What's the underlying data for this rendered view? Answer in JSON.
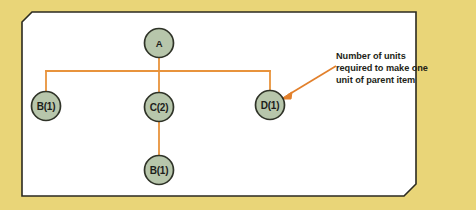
{
  "figure": {
    "kind": "bill-of-materials-tree",
    "panel_background": "#ffffff",
    "page_background": "#e9d578",
    "border_color": "#2b2a20",
    "connector_color": "#e8933c",
    "node_fill": "#b7c6ab",
    "node_stroke": "#2f3328",
    "text_color": "#1d1d1b"
  },
  "nodes": {
    "root": {
      "label": "A",
      "name": "node-a"
    },
    "child_left": {
      "label": "B(1)",
      "name": "node-b-left"
    },
    "child_middle": {
      "label": "C(2)",
      "name": "node-c"
    },
    "child_right": {
      "label": "D(1)",
      "name": "node-d"
    },
    "grandchild": {
      "label": "B(1)",
      "name": "node-b-bottom"
    }
  },
  "annotation": {
    "line1": "Number of units",
    "line2": "required to make one",
    "line3": "unit of parent item"
  }
}
